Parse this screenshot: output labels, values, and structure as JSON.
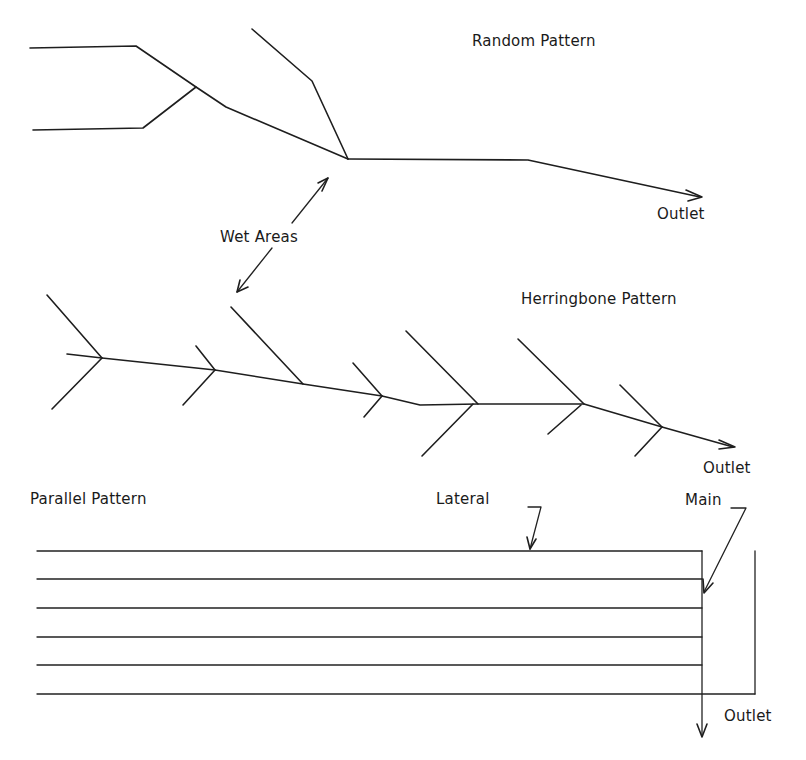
{
  "diagram": {
    "stroke_color": "#1e1e1e",
    "background": "#ffffff",
    "sections": [
      {
        "id": "random",
        "title": "Random Pattern",
        "outlet_label": "Outlet"
      },
      {
        "id": "herringbone",
        "title": "Herringbone Pattern",
        "outlet_label": "Outlet"
      },
      {
        "id": "parallel",
        "title": "Parallel Pattern",
        "outlet_label": "Outlet",
        "lateral_label": "Lateral",
        "main_label": "Main",
        "lateral_count": 6
      }
    ],
    "annotations": {
      "wet_areas": "Wet Areas"
    }
  }
}
